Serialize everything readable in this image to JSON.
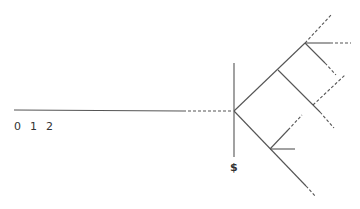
{
  "diagram": {
    "colors": {
      "line": "#555555",
      "text": "#333333",
      "background": "#ffffff"
    },
    "axis_labels": [
      "0",
      "1",
      "2"
    ],
    "barrier_label": "$",
    "elements": {
      "timeline_solid": {
        "x1": 14,
        "y1": 110,
        "x2": 183,
        "y2": 111
      },
      "timeline_dashed": {
        "x1": 183,
        "y1": 111,
        "x2": 233,
        "y2": 111
      },
      "barrier": {
        "x1": 234,
        "y1": 63,
        "x2": 234,
        "y2": 157
      }
    }
  }
}
